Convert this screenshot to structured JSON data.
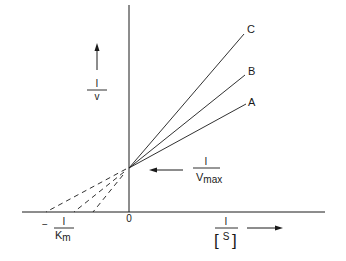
{
  "diagram": {
    "type": "Lineweaver-Burk plot (competitive inhibition)",
    "y_axis": {
      "numerator": "I",
      "denominator": "v"
    },
    "x_axis": {
      "numerator": "I",
      "denominator_open": "[",
      "denominator": "S",
      "denominator_close": "]"
    },
    "origin_label": "0",
    "y_intercept_label": {
      "numerator": "I",
      "denominator_main": "V",
      "denominator_sub": "max"
    },
    "x_intercept_label": {
      "sign": "−",
      "numerator": "I",
      "denominator_main": "K",
      "denominator_sub": "m"
    },
    "lines": [
      {
        "label": "A",
        "x_intercept": 93
      },
      {
        "label": "B",
        "x_intercept": 75
      },
      {
        "label": "C",
        "x_intercept": 47
      }
    ],
    "colors": {
      "stroke": "#1a1a1a",
      "background": "#ffffff"
    }
  }
}
